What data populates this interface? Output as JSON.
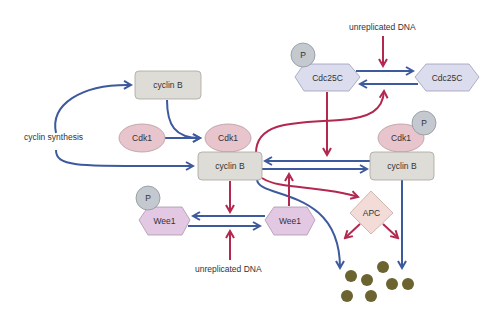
{
  "colors": {
    "activation": "#3d5a9e",
    "inhibition": "#b3284f",
    "cyclin_fill": "#dedcd6",
    "cdk_fill": "#e8c4cc",
    "p_fill": "#c4c8cf",
    "cdc25c_fill": "#dcdcef",
    "wee1_fill": "#e2c8e2",
    "apc_fill": "#f3dcd8",
    "degraded_fill": "#6b6330"
  },
  "labels": {
    "cyclin_synthesis": "cyclin synthesis",
    "unreplicated_dna_top": "unreplicated DNA",
    "unreplicated_dna_bottom": "unreplicated DNA"
  },
  "nodes": {
    "cyclin_b_free": "cyclin B",
    "cdk1_free": "Cdk1",
    "cdk1_bound": "Cdk1",
    "cyclin_b_complex": "cyclin B",
    "cdk1_phospho": "Cdk1",
    "cyclin_b_phospho": "cyclin B",
    "cdc25c_phospho": "Cdc25C",
    "cdc25c": "Cdc25C",
    "wee1_phospho": "Wee1",
    "wee1": "Wee1",
    "apc": "APC",
    "p_cdc25c": "P",
    "p_cdk1": "P",
    "p_wee1": "P"
  }
}
